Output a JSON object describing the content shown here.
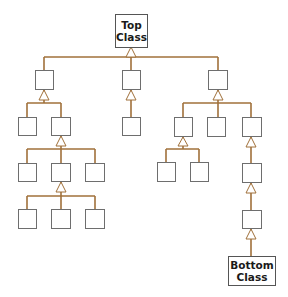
{
  "diagram": {
    "type": "class-inheritance-hierarchy",
    "connector_color": "#a0703a",
    "box_border_color": "#6e6e6e",
    "top_class": {
      "label_line1": "Top",
      "label_line2": "Class"
    },
    "bottom_class": {
      "label_line1": "Bottom",
      "label_line2": "Class"
    },
    "unlabeled_class_count": 20
  }
}
